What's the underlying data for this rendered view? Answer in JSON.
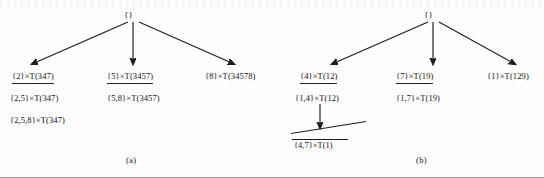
{
  "figure": {
    "width": 544,
    "height": 178,
    "background": "#fdfdfd",
    "ink_color": "#1d1d1d"
  },
  "panels": [
    {
      "id": "a",
      "caption": "(a)",
      "root": "{}",
      "level1": [
        {
          "label": "{2}×T(347)",
          "underlined": true
        },
        {
          "label": "{5}×T(3457)",
          "underlined": true
        },
        {
          "label": "{8}×T(34578)",
          "underlined": false
        }
      ],
      "level2": [
        {
          "label": "{2,5}×T(347)",
          "underlined": false
        },
        {
          "label": "{5,8}×T(3457)",
          "underlined": false
        }
      ],
      "level3": [
        {
          "label": "{2,5,8}×T(347)",
          "underlined": false
        }
      ]
    },
    {
      "id": "b",
      "caption": "(b)",
      "root": "{}",
      "level1": [
        {
          "label": "{4}×T(12)",
          "underlined": true
        },
        {
          "label": "{7}×T(19)",
          "underlined": true
        },
        {
          "label": "{1}×T(129)",
          "underlined": false
        }
      ],
      "level2": [
        {
          "label": "{1,4}×T(12)",
          "underlined": false
        },
        {
          "label": "{1,7}×T(19)",
          "underlined": false
        }
      ],
      "pruned": {
        "label": "{4,7}×T(1)",
        "crossed_out": true
      }
    }
  ]
}
